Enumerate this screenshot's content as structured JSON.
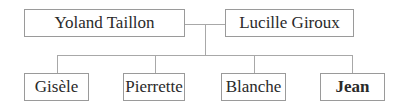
{
  "diagram": {
    "type": "family-tree",
    "parents": [
      {
        "name": "Yoland Taillon",
        "bold": false
      },
      {
        "name": "Lucille Giroux",
        "bold": false
      }
    ],
    "children": [
      {
        "name": "Gisèle",
        "bold": false
      },
      {
        "name": "Pierrette",
        "bold": false
      },
      {
        "name": "Blanche",
        "bold": false
      },
      {
        "name": "Jean",
        "bold": true
      }
    ],
    "colors": {
      "border": "#9a9a9a",
      "line": "#a8a8a8",
      "text": "#2a2a2a",
      "background": "#ffffff"
    }
  }
}
